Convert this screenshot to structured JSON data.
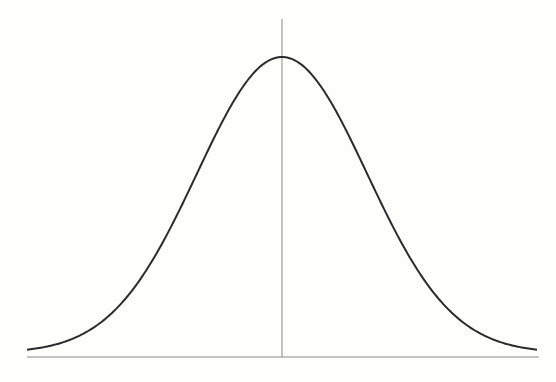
{
  "chart_data": {
    "type": "line",
    "title": "",
    "xlabel": "",
    "ylabel": "",
    "series": [
      {
        "name": "normal density",
        "mean": 0,
        "std": 1,
        "x_range": [
          -3,
          3
        ]
      }
    ],
    "x": [
      -3,
      -2.5,
      -2,
      -1.5,
      -1,
      -0.5,
      0,
      0.5,
      1,
      1.5,
      2,
      2.5,
      3
    ],
    "values": [
      0.0044,
      0.0175,
      0.054,
      0.1295,
      0.242,
      0.3521,
      0.3989,
      0.3521,
      0.242,
      0.1295,
      0.054,
      0.0175,
      0.0044
    ],
    "xlim": [
      -3,
      3
    ],
    "ylim": [
      0,
      0.4
    ],
    "grid": false,
    "legend": null,
    "mean_line": {
      "x": 0
    },
    "colors": {
      "curve": "#2b2b2b",
      "axis": "#8a8a8a",
      "background": "#fefefb"
    }
  }
}
